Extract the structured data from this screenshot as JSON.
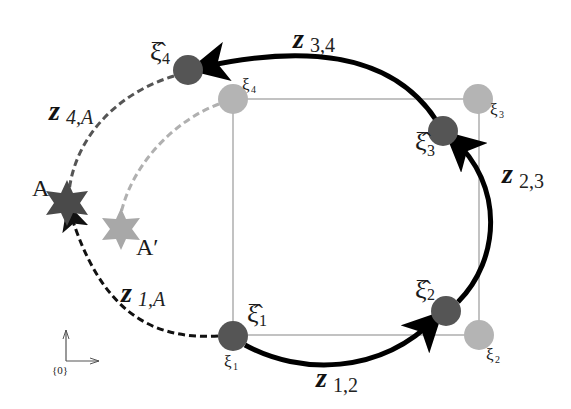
{
  "diagram": {
    "colors": {
      "square": "#9a9a9a",
      "true_pose": "#b4b4b4",
      "estimated_pose": "#555555",
      "odometry_edge": "#000000",
      "landmark_edge": "#333333",
      "true_landmark_edge": "#b0b0b0",
      "landmark_A": "#4a4a4a",
      "landmark_A_prime": "#a8a8a8",
      "frame_axes": "#555555"
    },
    "true_poses": [
      {
        "id": "xi1",
        "label": "ξ",
        "sub": "1"
      },
      {
        "id": "xi2",
        "label": "ξ",
        "sub": "2"
      },
      {
        "id": "xi3",
        "label": "ξ",
        "sub": "3"
      },
      {
        "id": "xi4",
        "label": "ξ",
        "sub": "4"
      }
    ],
    "estimated_poses": [
      {
        "id": "xihat1",
        "label": "ξ̂",
        "sub": "1"
      },
      {
        "id": "xihat2",
        "label": "ξ̂",
        "sub": "2"
      },
      {
        "id": "xihat3",
        "label": "ξ̂",
        "sub": "3"
      },
      {
        "id": "xihat4",
        "label": "ξ̂",
        "sub": "4"
      }
    ],
    "edges": [
      {
        "id": "z12",
        "label": "z",
        "sub": "1,2",
        "style": "solid-arrow"
      },
      {
        "id": "z23",
        "label": "z",
        "sub": "2,3",
        "style": "solid-arrow"
      },
      {
        "id": "z34",
        "label": "z",
        "sub": "3,4",
        "style": "solid-arrow"
      },
      {
        "id": "z4A",
        "label": "z",
        "sub": "4,A",
        "style": "dashed"
      },
      {
        "id": "z1A",
        "label": "z",
        "sub": "1,A",
        "style": "dashed-arrow"
      }
    ],
    "landmarks": [
      {
        "id": "A",
        "label": "A"
      },
      {
        "id": "A_prime",
        "label": "A′"
      }
    ],
    "frame": {
      "label": "{0}"
    }
  }
}
